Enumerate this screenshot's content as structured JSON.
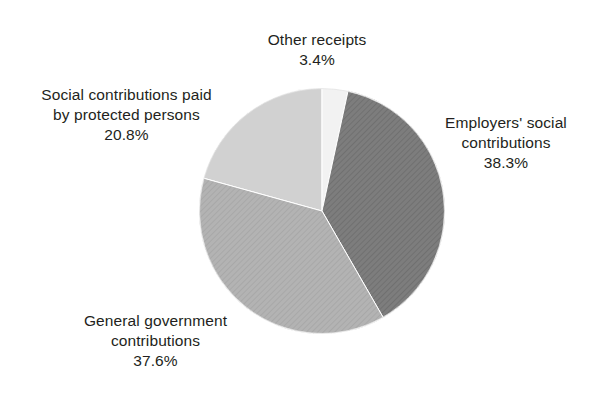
{
  "chart_data": {
    "type": "pie",
    "title": "",
    "subtitle": "",
    "xlabel": "",
    "ylabel": "",
    "legend_position": "none",
    "grid": false,
    "units": "percent",
    "start_angle_deg": 0,
    "direction": "clockwise",
    "center": {
      "x": 322,
      "y": 211,
      "radius": 123
    },
    "categories": [
      "Other receipts",
      "Employers' social contributions",
      "General government contributions",
      "Social contributions paid by protected persons"
    ],
    "values": [
      3.4,
      38.3,
      37.6,
      20.8
    ],
    "value_labels": [
      "3.4%",
      "38.3%",
      "37.6%",
      "20.8%"
    ],
    "colors": [
      "#f2f2f2",
      "#7d7d7d",
      "#b3b3b3",
      "#d1d1d1"
    ],
    "slices": [
      {
        "name": "Other receipts",
        "value": 3.4,
        "value_label": "3.4%",
        "color": "#f2f2f2",
        "pattern": "solid",
        "start_deg": 0.0,
        "end_deg": 12.24
      },
      {
        "name": "Employers' social contributions",
        "value": 38.3,
        "value_label": "38.3%",
        "color": "#7d7d7d",
        "pattern": "diagonal-hatch",
        "start_deg": 12.24,
        "end_deg": 150.12
      },
      {
        "name": "General government contributions",
        "value": 37.6,
        "value_label": "37.6%",
        "color": "#b3b3b3",
        "pattern": "diagonal-hatch",
        "start_deg": 150.12,
        "end_deg": 285.48
      },
      {
        "name": "Social contributions paid by protected persons",
        "value": 20.8,
        "value_label": "20.8%",
        "color": "#d1d1d1",
        "pattern": "solid",
        "start_deg": 285.48,
        "end_deg": 360.0
      }
    ]
  },
  "labels": {
    "other_receipts": {
      "line1": "Other receipts",
      "value": "3.4%"
    },
    "employers": {
      "line1": "Employers' social",
      "line2": "contributions",
      "value": "38.3%"
    },
    "general_government": {
      "line1": "General government",
      "line2": "contributions",
      "value": "37.6%"
    },
    "social_contributions": {
      "line1": "Social contributions paid",
      "line2": "by protected persons",
      "value": "20.8%"
    }
  },
  "style": {
    "background": "#ffffff",
    "text_color": "#231f20",
    "slice_border": "#ffffff"
  }
}
